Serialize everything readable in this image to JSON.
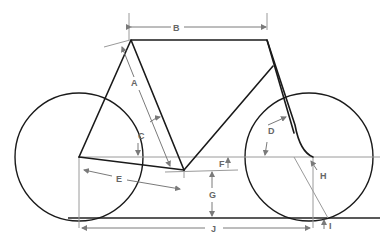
{
  "diagram": {
    "labels": {
      "A": "A",
      "B": "B",
      "C": "C",
      "D": "D",
      "E": "E",
      "F": "F",
      "G": "G",
      "H": "H",
      "I": "I",
      "J": "J"
    },
    "colors": {
      "frame": "#1a1a1a",
      "dimension": "#7a7a7a",
      "guide": "#9a9a9a",
      "background": "#ffffff"
    }
  }
}
